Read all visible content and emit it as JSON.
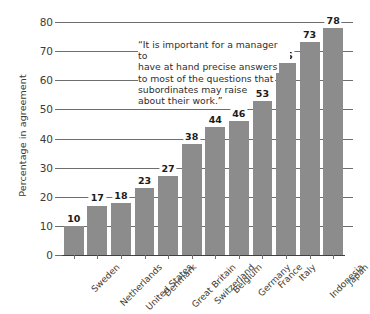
{
  "chart_data": {
    "type": "bar",
    "title": "",
    "xlabel": "",
    "ylabel": "Percentage in agreement",
    "ylim": [
      0,
      80
    ],
    "yticks": [
      0,
      10,
      20,
      30,
      40,
      50,
      60,
      70,
      80
    ],
    "grid": true,
    "legend": null,
    "categories": [
      "Sweden",
      "Netherlands",
      "United States",
      "Denmark",
      "Great Britain",
      "Switzerland",
      "Belgium",
      "Germany",
      "France",
      "Italy",
      "Indonesia",
      "Japan"
    ],
    "values": [
      10,
      17,
      18,
      23,
      27,
      38,
      44,
      46,
      53,
      66,
      73,
      78
    ],
    "bar_color": "#8c8c8c",
    "annotations": [
      {
        "id": "quote",
        "lines": [
          "“It is important for a manager to",
          "have at hand precise answers",
          "to most of the questions that",
          "subordinates may raise",
          "about their work.”"
        ]
      }
    ]
  }
}
